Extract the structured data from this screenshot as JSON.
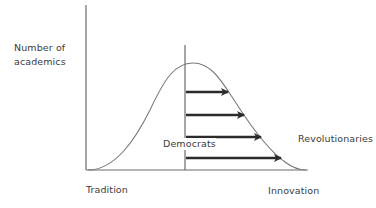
{
  "diagram": {
    "type": "bell-curve-diffusion",
    "y_axis_label_line1": "Number of",
    "y_axis_label_line2": "academics",
    "x_axis_left_label": "Tradition",
    "x_axis_right_label": "Innovation",
    "segment_labels": {
      "middle": "Democrats",
      "right": "Revolutionaries"
    },
    "arrows_count": 4,
    "arrow_direction": "right",
    "colors": {
      "line": "#6b6b6b",
      "curve": "#7a7a7a",
      "arrow": "#2b2b2b",
      "text": "#3c3c3c"
    }
  }
}
